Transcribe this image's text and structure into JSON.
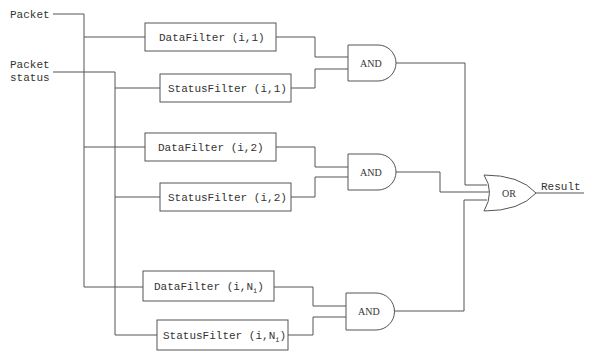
{
  "diagram": {
    "inputs": [
      {
        "id": "packet",
        "label": "Packet"
      },
      {
        "id": "packet_status",
        "label_line1": "Packet",
        "label_line2": "status"
      }
    ],
    "filters": [
      {
        "id": "df1",
        "name": "DataFilter",
        "args": "(i,1)",
        "subscript": ""
      },
      {
        "id": "sf1",
        "name": "StatusFilter",
        "args": "(i,1)",
        "subscript": ""
      },
      {
        "id": "df2",
        "name": "DataFilter",
        "args": "(i,2)",
        "subscript": ""
      },
      {
        "id": "sf2",
        "name": "StatusFilter",
        "args": "(i,2)",
        "subscript": ""
      },
      {
        "id": "dfn",
        "name": "DataFilter",
        "args_prefix": "(i,N",
        "subscript": "i",
        "args_suffix": ")"
      },
      {
        "id": "sfn",
        "name": "StatusFilter",
        "args_prefix": "(i,N",
        "subscript": "i",
        "args_suffix": ")"
      }
    ],
    "gates": [
      {
        "id": "and1",
        "type": "AND",
        "label": "AND"
      },
      {
        "id": "and2",
        "type": "AND",
        "label": "AND"
      },
      {
        "id": "and3",
        "type": "AND",
        "label": "AND"
      },
      {
        "id": "or1",
        "type": "OR",
        "label": "OR"
      }
    ],
    "output": {
      "label": "Result"
    },
    "colors": {
      "line": "#555555",
      "text": "#333333",
      "background": "#ffffff"
    }
  }
}
